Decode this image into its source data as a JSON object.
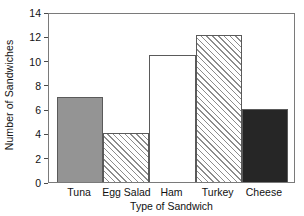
{
  "chart_data": {
    "type": "bar",
    "title": "",
    "subtitle": "",
    "xlabel": "Type of Sandwich",
    "ylabel": "Number of Sandwiches",
    "categories": [
      "Tuna",
      "Egg Salad",
      "Ham",
      "Turkey",
      "Cheese"
    ],
    "values": [
      7,
      4,
      10.5,
      12.1,
      6
    ],
    "ylim": [
      0,
      14
    ],
    "y_ticks": [
      0,
      2,
      4,
      6,
      8,
      10,
      12,
      14
    ],
    "y_tick_labels": [
      "0",
      "2",
      "4",
      "6",
      "8",
      "10",
      "12",
      "14"
    ],
    "grid": false,
    "legend": "none",
    "bar_gap": "none",
    "bar_styles": [
      {
        "category": "Tuna",
        "fill": "solid-gray",
        "color": "#949494"
      },
      {
        "category": "Egg Salad",
        "fill": "hatch-diagonal",
        "color": "#ffffff"
      },
      {
        "category": "Ham",
        "fill": "white",
        "color": "#ffffff"
      },
      {
        "category": "Turkey",
        "fill": "hatch-diagonal",
        "color": "#ffffff"
      },
      {
        "category": "Cheese",
        "fill": "solid-dark",
        "color": "#262626"
      }
    ],
    "frame_color": "#7a7a7a",
    "bar_edge_color": "#5a5a5a",
    "hatch_color": "#8c8c8c"
  }
}
